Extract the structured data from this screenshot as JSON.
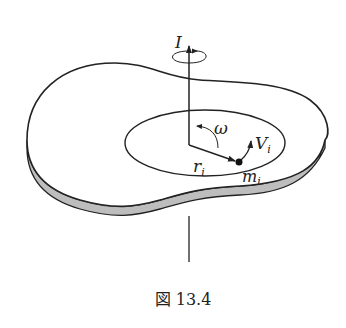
{
  "figure": {
    "caption": "図 13.4",
    "labels": {
      "axis_moment": "I",
      "angular_velocity": "ω",
      "radius": "r",
      "radius_sub": "i",
      "velocity": "V",
      "velocity_sub": "i",
      "mass": "m",
      "mass_sub": "i"
    },
    "colors": {
      "stroke": "#222222",
      "disk_edge": "#b8b8b8",
      "background": "#ffffff"
    }
  }
}
